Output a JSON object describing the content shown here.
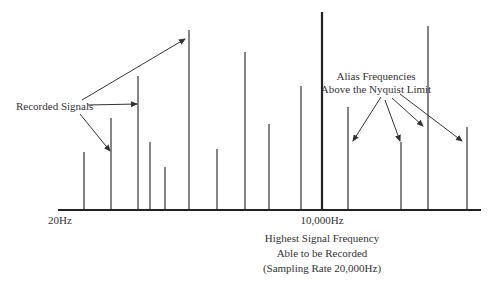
{
  "labels": {
    "recorded_signals": "Recorded Signals",
    "alias_line1": "Alias Frequencies",
    "alias_line2": "Above the Nyquist Limit",
    "axis_start": "20Hz",
    "axis_mid": "10,000Hz",
    "nyquist_line1": "Highest Signal Frequency",
    "nyquist_line2": "Able to be Recorded",
    "nyquist_line3": "(Sampling Rate 20,000Hz)"
  },
  "colors": {
    "line": "#333333",
    "text": "#333333",
    "background": "#ffffff"
  },
  "axis": {
    "x_start": 58,
    "x_end": 481,
    "y": 210
  },
  "nyquist_line": {
    "x": 322,
    "top": 12
  },
  "signals": [
    {
      "x": 84,
      "top": 152,
      "type": "recorded"
    },
    {
      "x": 111,
      "top": 118,
      "type": "recorded"
    },
    {
      "x": 138,
      "top": 76,
      "type": "recorded"
    },
    {
      "x": 150,
      "top": 142,
      "type": "recorded"
    },
    {
      "x": 165,
      "top": 167,
      "type": "recorded"
    },
    {
      "x": 189,
      "top": 30,
      "type": "recorded"
    },
    {
      "x": 217,
      "top": 149,
      "type": "recorded"
    },
    {
      "x": 245,
      "top": 52,
      "type": "recorded"
    },
    {
      "x": 269,
      "top": 124,
      "type": "recorded"
    },
    {
      "x": 301,
      "top": 86,
      "type": "recorded"
    },
    {
      "x": 348,
      "top": 107,
      "type": "alias"
    },
    {
      "x": 401,
      "top": 142,
      "type": "alias"
    },
    {
      "x": 428,
      "top": 26,
      "type": "alias"
    },
    {
      "x": 467,
      "top": 127,
      "type": "alias"
    }
  ],
  "arrows": [
    {
      "x1": 82,
      "y1": 100,
      "x2": 185,
      "y2": 39
    },
    {
      "x1": 88,
      "y1": 105,
      "x2": 137,
      "y2": 104
    },
    {
      "x1": 80,
      "y1": 114,
      "x2": 110,
      "y2": 151
    },
    {
      "x1": 381,
      "y1": 97,
      "x2": 353,
      "y2": 141
    },
    {
      "x1": 385,
      "y1": 100,
      "x2": 400,
      "y2": 141
    },
    {
      "x1": 392,
      "y1": 98,
      "x2": 423,
      "y2": 126
    },
    {
      "x1": 400,
      "y1": 94,
      "x2": 462,
      "y2": 141
    }
  ]
}
